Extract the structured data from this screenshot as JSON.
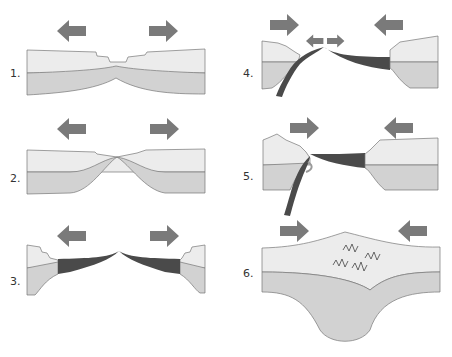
{
  "colors": {
    "arrow": "#7a7a7a",
    "upper_crust": "#ececec",
    "lower_crust": "#d2d2d2",
    "oceanic_crust": "#4a4a4a",
    "outline": "#777777"
  },
  "panels": [
    {
      "label": "1.",
      "arrows": [
        "left",
        "right"
      ]
    },
    {
      "label": "2.",
      "arrows": [
        "left",
        "right"
      ]
    },
    {
      "label": "3.",
      "arrows": [
        "left",
        "right"
      ]
    },
    {
      "label": "4.",
      "arrows": [
        "right",
        "left",
        "small-left",
        "small-right"
      ]
    },
    {
      "label": "5.",
      "arrows": [
        "right",
        "left",
        "subduction-curved"
      ]
    },
    {
      "label": "6.",
      "arrows": [
        "right",
        "left"
      ]
    }
  ]
}
